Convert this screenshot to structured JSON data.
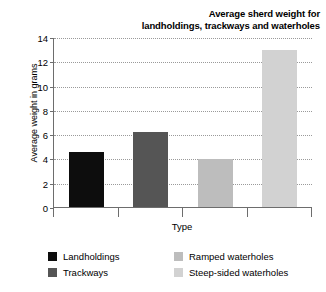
{
  "chart_data": {
    "type": "bar",
    "title": "Average sherd weight for landholdings, trackways and waterholes",
    "title_lines": [
      "Average sherd weight for",
      "landholdings, trackways and waterholes"
    ],
    "xlabel": "Type",
    "ylabel": "Average weight in grams",
    "ylim": [
      0,
      14
    ],
    "ytick_step": 2,
    "yticks": [
      0,
      2,
      4,
      6,
      8,
      10,
      12,
      14
    ],
    "ytick_labels": [
      "0",
      "2",
      "4",
      "6",
      "8",
      "10",
      "12",
      "14"
    ],
    "grid": true,
    "grid_style": "dotted",
    "legend_position": "below",
    "categories": [
      "Landholdings",
      "Trackways",
      "Ramped waterholes",
      "Steep-sided waterholes"
    ],
    "values": [
      4.6,
      6.3,
      4.0,
      13.0
    ],
    "colors": [
      "#0d0d0d",
      "#555555",
      "#bdbdbd",
      "#d2d2d2"
    ],
    "legend": [
      {
        "label": "Landholdings",
        "color": "#0d0d0d"
      },
      {
        "label": "Trackways",
        "color": "#555555"
      },
      {
        "label": "Ramped waterholes",
        "color": "#bdbdbd"
      },
      {
        "label": "Steep-sided waterholes",
        "color": "#d2d2d2"
      }
    ],
    "axis_color": "#6d6d6d",
    "grid_color": "#9a9a9a",
    "background": "#ffffff"
  }
}
